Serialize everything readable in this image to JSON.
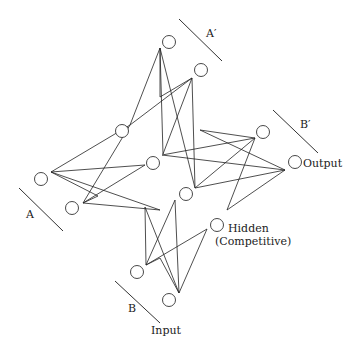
{
  "labels": {
    "a": "A",
    "a_prime": "A′",
    "b": "B",
    "b_prime": "B′",
    "output": "Output",
    "input": "Input",
    "hidden": "Hidden",
    "hidden_sub": "(Competitive)"
  },
  "layers": [
    {
      "name": "A",
      "units": 2
    },
    {
      "name": "A′",
      "units": 2
    },
    {
      "name": "B",
      "units": 2
    },
    {
      "name": "B′",
      "units": 2
    },
    {
      "name": "Hidden (Competitive)",
      "units": 4
    }
  ],
  "connections": "each pattern unit fully connected to every hidden unit"
}
